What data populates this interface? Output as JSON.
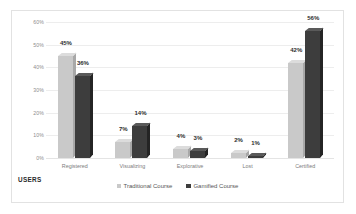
{
  "chart": {
    "axis_title": "USERS",
    "y_ticks": [
      "0%",
      "10%",
      "20%",
      "30%",
      "40%",
      "50%",
      "60%"
    ],
    "legend": [
      {
        "label": "Traditional Course",
        "color": "#c9c9c9",
        "marker": "square-swatch-light"
      },
      {
        "label": "Gamified Course",
        "color": "#3d3d3d",
        "marker": "square-swatch-dark"
      }
    ]
  },
  "chart_data": {
    "type": "bar",
    "title": "",
    "xlabel": "USERS",
    "ylabel": "",
    "ylim": [
      0,
      60
    ],
    "grid": true,
    "legend_position": "bottom",
    "categories": [
      "Registered",
      "Visualizing",
      "Explorative",
      "Lost",
      "Certified"
    ],
    "series": [
      {
        "name": "Traditional Course",
        "color": "#c9c9c9",
        "values": [
          45,
          7,
          4,
          2,
          42
        ],
        "labels": [
          "45%",
          "7%",
          "4%",
          "2%",
          "42%"
        ]
      },
      {
        "name": "Gamified Course",
        "color": "#3d3d3d",
        "values": [
          36,
          14,
          3,
          1,
          56
        ],
        "labels": [
          "36%",
          "14%",
          "3%",
          "1%",
          "56%"
        ]
      }
    ]
  }
}
